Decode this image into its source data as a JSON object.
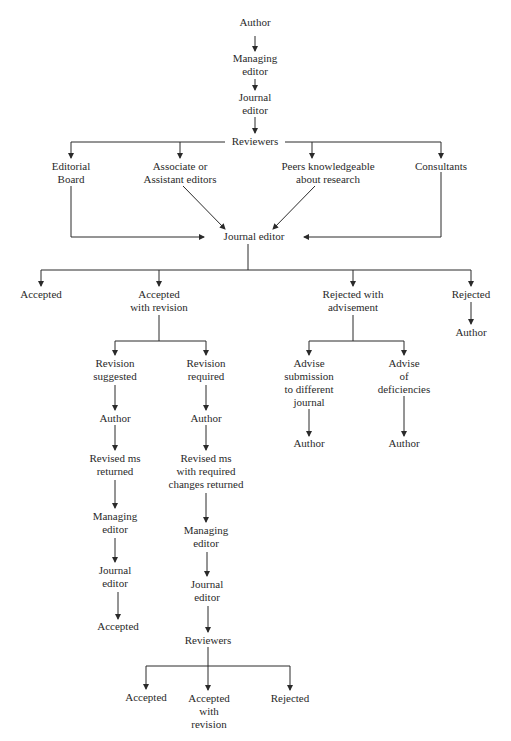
{
  "diagram": {
    "title": "",
    "type": "flowchart",
    "line_color": "#2a2a2a",
    "nodes": [
      {
        "id": "author_top",
        "label": "Author",
        "x": 255,
        "y": 23
      },
      {
        "id": "managing_top",
        "label": "Managing\neditor",
        "x": 255,
        "y": 52
      },
      {
        "id": "journal_top",
        "label": "Journal\neditor",
        "x": 255,
        "y": 91
      },
      {
        "id": "reviewers_top",
        "label": "Reviewers",
        "x": 255,
        "y": 135
      },
      {
        "id": "editorial_board",
        "label": "Editorial\nBoard",
        "x": 71,
        "y": 160
      },
      {
        "id": "associate_editors",
        "label": "Associate or\nAssistant editors",
        "x": 180,
        "y": 160
      },
      {
        "id": "peers",
        "label": "Peers knowledgeable\nabout research",
        "x": 328,
        "y": 160
      },
      {
        "id": "consultants",
        "label": "Consultants",
        "x": 441,
        "y": 160
      },
      {
        "id": "journal_mid",
        "label": "Journal editor",
        "x": 254,
        "y": 230
      },
      {
        "id": "accepted_1",
        "label": "Accepted",
        "x": 41,
        "y": 288
      },
      {
        "id": "accepted_with_revision_1",
        "label": "Accepted\nwith revision",
        "x": 159,
        "y": 288
      },
      {
        "id": "rejected_with_advisement",
        "label": "Rejected with\nadvisement",
        "x": 353,
        "y": 288
      },
      {
        "id": "rejected_1",
        "label": "Rejected",
        "x": 471,
        "y": 288
      },
      {
        "id": "author_rejected",
        "label": "Author",
        "x": 471,
        "y": 326
      },
      {
        "id": "revision_suggested",
        "label": "Revision\nsuggested",
        "x": 115,
        "y": 357
      },
      {
        "id": "revision_required",
        "label": "Revision\nrequired",
        "x": 206,
        "y": 357
      },
      {
        "id": "advise_submission",
        "label": "Advise\nsubmission\nto different\njournal",
        "x": 309,
        "y": 357
      },
      {
        "id": "advise_deficiencies",
        "label": "Advise\nof\ndeficiencies",
        "x": 404,
        "y": 357
      },
      {
        "id": "author_suggested",
        "label": "Author",
        "x": 115,
        "y": 412
      },
      {
        "id": "author_required",
        "label": "Author",
        "x": 206,
        "y": 412
      },
      {
        "id": "author_submission",
        "label": "Author",
        "x": 309,
        "y": 437
      },
      {
        "id": "author_deficiencies",
        "label": "Author",
        "x": 404,
        "y": 437
      },
      {
        "id": "revised_returned",
        "label": "Revised ms\nreturned",
        "x": 115,
        "y": 452
      },
      {
        "id": "revised_required_returned",
        "label": "Revised ms\nwith required\nchanges returned",
        "x": 206,
        "y": 452
      },
      {
        "id": "managing_suggested",
        "label": "Managing\neditor",
        "x": 115,
        "y": 510
      },
      {
        "id": "managing_required",
        "label": "Managing\neditor",
        "x": 206,
        "y": 524
      },
      {
        "id": "journal_suggested",
        "label": "Journal\neditor",
        "x": 115,
        "y": 564
      },
      {
        "id": "journal_required",
        "label": "Journal\neditor",
        "x": 207,
        "y": 578
      },
      {
        "id": "accepted_suggested",
        "label": "Accepted",
        "x": 118,
        "y": 620
      },
      {
        "id": "reviewers_bottom",
        "label": "Reviewers",
        "x": 208,
        "y": 634
      },
      {
        "id": "accepted_bottom",
        "label": "Accepted",
        "x": 146,
        "y": 691
      },
      {
        "id": "accepted_with_revision_bottom",
        "label": "Accepted\nwith\nrevision",
        "x": 209,
        "y": 692
      },
      {
        "id": "rejected_bottom",
        "label": "Rejected",
        "x": 290,
        "y": 692
      }
    ],
    "edges": [
      {
        "from": "author_top",
        "to": "managing_top"
      },
      {
        "from": "managing_top",
        "to": "journal_top"
      },
      {
        "from": "journal_top",
        "to": "reviewers_top"
      },
      {
        "from": "reviewers_top",
        "to": "editorial_board"
      },
      {
        "from": "reviewers_top",
        "to": "associate_editors"
      },
      {
        "from": "reviewers_top",
        "to": "peers"
      },
      {
        "from": "reviewers_top",
        "to": "consultants"
      },
      {
        "from": "editorial_board",
        "to": "journal_mid"
      },
      {
        "from": "associate_editors",
        "to": "journal_mid"
      },
      {
        "from": "peers",
        "to": "journal_mid"
      },
      {
        "from": "consultants",
        "to": "journal_mid"
      },
      {
        "from": "journal_mid",
        "to": "accepted_1"
      },
      {
        "from": "journal_mid",
        "to": "accepted_with_revision_1"
      },
      {
        "from": "journal_mid",
        "to": "rejected_with_advisement"
      },
      {
        "from": "journal_mid",
        "to": "rejected_1"
      },
      {
        "from": "rejected_1",
        "to": "author_rejected"
      },
      {
        "from": "accepted_with_revision_1",
        "to": "revision_suggested"
      },
      {
        "from": "accepted_with_revision_1",
        "to": "revision_required"
      },
      {
        "from": "rejected_with_advisement",
        "to": "advise_submission"
      },
      {
        "from": "rejected_with_advisement",
        "to": "advise_deficiencies"
      },
      {
        "from": "advise_submission",
        "to": "author_submission"
      },
      {
        "from": "advise_deficiencies",
        "to": "author_deficiencies"
      },
      {
        "from": "revision_suggested",
        "to": "author_suggested"
      },
      {
        "from": "author_suggested",
        "to": "revised_returned"
      },
      {
        "from": "revised_returned",
        "to": "managing_suggested"
      },
      {
        "from": "managing_suggested",
        "to": "journal_suggested"
      },
      {
        "from": "journal_suggested",
        "to": "accepted_suggested"
      },
      {
        "from": "revision_required",
        "to": "author_required"
      },
      {
        "from": "author_required",
        "to": "revised_required_returned"
      },
      {
        "from": "revised_required_returned",
        "to": "managing_required"
      },
      {
        "from": "managing_required",
        "to": "journal_required"
      },
      {
        "from": "journal_required",
        "to": "reviewers_bottom"
      },
      {
        "from": "reviewers_bottom",
        "to": "accepted_bottom"
      },
      {
        "from": "reviewers_bottom",
        "to": "accepted_with_revision_bottom"
      },
      {
        "from": "reviewers_bottom",
        "to": "rejected_bottom"
      }
    ]
  }
}
